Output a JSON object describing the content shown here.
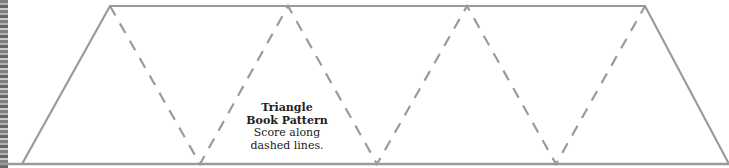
{
  "pattern": {
    "title_line1": "Triangle",
    "title_line2": "Book Pattern",
    "instruction_line1": "Score along",
    "instruction_line2": "dashed lines."
  },
  "colors": {
    "outline": "#9a9a9a",
    "fold_lines": "#9a9a9a",
    "text": "#222222",
    "background": "#ffffff"
  },
  "geometry": {
    "top_vertices_x": [
      110,
      288,
      467,
      645
    ],
    "bottom_vertices_x": [
      22,
      200,
      377,
      556,
      729
    ],
    "top_y": 6,
    "bottom_y": 164
  }
}
